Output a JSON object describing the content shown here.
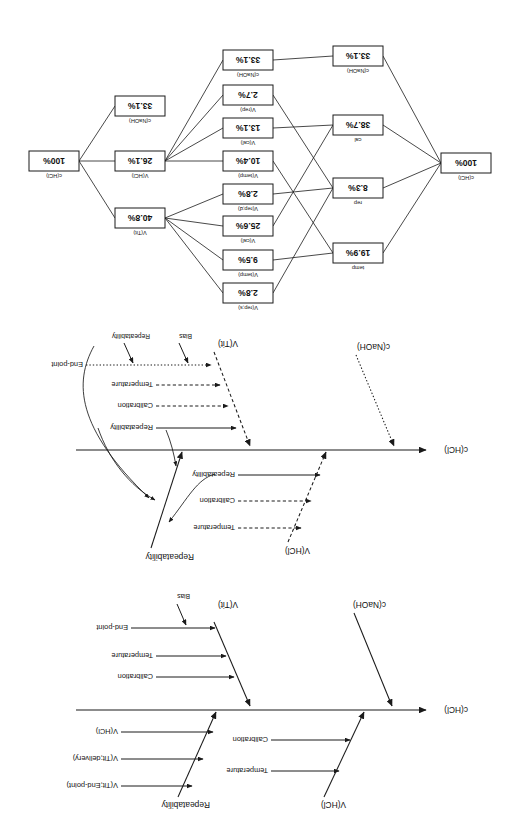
{
  "figure": {
    "orientation": "upside-down-scan",
    "panel_count": 3,
    "ink_color": "#1a1a1a",
    "paper_color": "#ffffff"
  },
  "panels": [
    {
      "id": "panel-a",
      "kind": "cause-and-effect-fishbone",
      "effect_label": "c(HCl)",
      "branches": [
        {
          "name": "V(HCl)",
          "side": "upper",
          "style": "solid",
          "causes": [
            {
              "label": "Temperature",
              "style": "solid"
            },
            {
              "label": "Calibration",
              "style": "solid"
            }
          ]
        },
        {
          "name": "Repeatability",
          "side": "upper",
          "style": "solid",
          "causes": [
            {
              "label": "V(Tit;End-point)",
              "style": "solid"
            },
            {
              "label": "V(Tit;delivery)",
              "style": "solid"
            },
            {
              "label": "V(HCl)",
              "style": "solid"
            }
          ]
        },
        {
          "name": "c(NaOH)",
          "side": "lower",
          "style": "solid",
          "causes": []
        },
        {
          "name": "V(Tit)",
          "side": "lower",
          "style": "solid",
          "causes": [
            {
              "label": "Calibration",
              "style": "solid"
            },
            {
              "label": "Temperature",
              "style": "solid"
            },
            {
              "label": "End-point",
              "style": "solid"
            }
          ],
          "sub_causes": [
            {
              "label": "Bias",
              "attaches_to": "End-point"
            }
          ]
        }
      ]
    },
    {
      "id": "panel-b",
      "kind": "cause-and-effect-fishbone-reassigned",
      "effect_label": "c(HCl)",
      "branches": [
        {
          "name": "V(HCl)",
          "side": "upper",
          "style": "dashed",
          "causes": [
            {
              "label": "Temperature",
              "style": "dashed"
            },
            {
              "label": "Calibration",
              "style": "dashed"
            },
            {
              "label": "Repeatability",
              "style": "solid"
            }
          ]
        },
        {
          "name": "Repeatability",
          "side": "upper",
          "style": "solid",
          "causes": []
        },
        {
          "name": "c(NaOH)",
          "side": "lower",
          "style": "dotted",
          "causes": []
        },
        {
          "name": "V(Tit)",
          "side": "lower",
          "style": "dashed",
          "causes": [
            {
              "label": "Repeatability",
              "style": "solid"
            },
            {
              "label": "Calibration",
              "style": "dashed"
            },
            {
              "label": "Temperature",
              "style": "dashed"
            },
            {
              "label": "End-point",
              "style": "dotted"
            }
          ],
          "sub_causes": [
            {
              "label": "Bias",
              "attaches_to": "End-point"
            },
            {
              "label": "Repeatability",
              "attaches_to": "End-point"
            }
          ]
        }
      ],
      "regroup_arrows": 4
    },
    {
      "id": "panel-c",
      "kind": "uncertainty-contribution-network"
    }
  ],
  "chart_data": {
    "type": "diagram",
    "title": "",
    "subtype": "contribution-network",
    "columns": [
      {
        "name": "source",
        "nodes": [
          {
            "id": "src-cHCl",
            "caption": "c(HCl)",
            "value": "100%",
            "number": 100
          }
        ]
      },
      {
        "name": "influence",
        "nodes": [
          {
            "id": "inf-temp",
            "caption": "temp",
            "value": "19.9%",
            "number": 19.9
          },
          {
            "id": "inf-rep",
            "caption": "rep",
            "value": "8.3%",
            "number": 8.3
          },
          {
            "id": "inf-cal",
            "caption": "cal",
            "value": "38.7%",
            "number": 38.7
          },
          {
            "id": "inf-cnaoh",
            "caption": "c(NaOH)",
            "value": "33.1%",
            "number": 33.1
          }
        ]
      },
      {
        "name": "intermediate",
        "nodes": [
          {
            "id": "mid-vreps",
            "caption": "V(rep;s)",
            "value": "2.8%",
            "number": 2.8
          },
          {
            "id": "mid-vtemp1",
            "caption": "V(temp)",
            "value": "9.5%",
            "number": 9.5
          },
          {
            "id": "mid-vcal1",
            "caption": "V(cal)",
            "value": "25.6%",
            "number": 25.6
          },
          {
            "id": "mid-vrepd",
            "caption": "V(rep;d)",
            "value": "2.8%",
            "number": 2.8
          },
          {
            "id": "mid-vtemp2",
            "caption": "V(temp)",
            "value": "10.4%",
            "number": 10.4
          },
          {
            "id": "mid-vcal2",
            "caption": "V(cal)",
            "value": "13.1%",
            "number": 13.1
          },
          {
            "id": "mid-vrep",
            "caption": "V(rep)",
            "value": "2.7%",
            "number": 2.7
          },
          {
            "id": "mid-cnaoh",
            "caption": "c(NaOH)",
            "value": "33.1%",
            "number": 33.1
          }
        ]
      },
      {
        "name": "aggregate",
        "nodes": [
          {
            "id": "agg-vtit",
            "caption": "V(Tit)",
            "value": "40.8%",
            "number": 40.8
          },
          {
            "id": "agg-vhcl",
            "caption": "V(HCl)",
            "value": "26.1%",
            "number": 26.1
          },
          {
            "id": "agg-cnaoh",
            "caption": "c(NaOH)",
            "value": "33.1%",
            "number": 33.1
          }
        ]
      },
      {
        "name": "result",
        "nodes": [
          {
            "id": "res-chcl",
            "caption": "c(HCl)",
            "value": "100%",
            "number": 100
          }
        ]
      }
    ],
    "edges": [
      [
        "src-cHCl",
        "inf-temp"
      ],
      [
        "src-cHCl",
        "inf-rep"
      ],
      [
        "src-cHCl",
        "inf-cal"
      ],
      [
        "src-cHCl",
        "inf-cnaoh"
      ],
      [
        "inf-temp",
        "mid-vtemp1"
      ],
      [
        "inf-temp",
        "mid-vtemp2"
      ],
      [
        "inf-rep",
        "mid-vreps"
      ],
      [
        "inf-rep",
        "mid-vrepd"
      ],
      [
        "inf-rep",
        "mid-vrep"
      ],
      [
        "inf-cal",
        "mid-vcal1"
      ],
      [
        "inf-cal",
        "mid-vcal2"
      ],
      [
        "inf-cnaoh",
        "mid-cnaoh"
      ],
      [
        "mid-vreps",
        "agg-vtit"
      ],
      [
        "mid-vtemp1",
        "agg-vtit"
      ],
      [
        "mid-vcal1",
        "agg-vtit"
      ],
      [
        "mid-vrepd",
        "agg-vtit"
      ],
      [
        "mid-vtemp2",
        "agg-vhcl"
      ],
      [
        "mid-vcal2",
        "agg-vhcl"
      ],
      [
        "mid-vrep",
        "agg-vhcl"
      ],
      [
        "mid-cnaoh",
        "agg-vhcl"
      ],
      [
        "agg-vtit",
        "res-chcl"
      ],
      [
        "agg-vhcl",
        "res-chcl"
      ],
      [
        "agg-cnaoh",
        "res-chcl"
      ]
    ]
  }
}
